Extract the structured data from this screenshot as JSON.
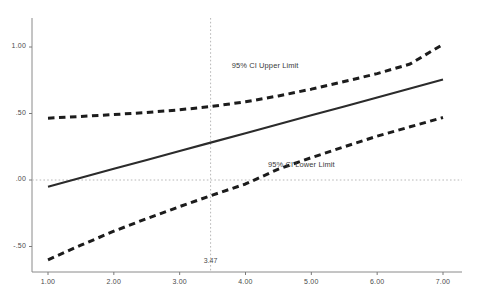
{
  "chart_data": {
    "type": "line",
    "title": "",
    "subtitle": "",
    "xlabel": "",
    "ylabel": "",
    "xlim": [
      0.7,
      7.35
    ],
    "ylim": [
      -0.7,
      1.13
    ],
    "grid": false,
    "legend_position": "inline-annotations",
    "x_ticks": [
      "1.00",
      "2.00",
      "3.00",
      "4.00",
      "5.00",
      "6.00",
      "7.00"
    ],
    "x_tick_values": [
      1.0,
      2.0,
      3.0,
      4.0,
      5.0,
      6.0,
      7.0
    ],
    "y_ticks": [
      "1.00",
      ".50",
      ".00",
      "-.50"
    ],
    "y_tick_values": [
      1.0,
      0.5,
      0.0,
      -0.5
    ],
    "x": [
      1.0,
      1.5,
      2.0,
      2.5,
      3.0,
      3.47,
      4.0,
      4.5,
      5.0,
      5.5,
      6.0,
      6.5,
      7.0
    ],
    "series": [
      {
        "name": "Fit Line",
        "style": "solid",
        "color": "#2b2b2b",
        "values": [
          -0.05,
          0.017,
          0.084,
          0.151,
          0.218,
          0.281,
          0.352,
          0.419,
          0.486,
          0.553,
          0.621,
          0.688,
          0.755
        ]
      },
      {
        "name": "95% CI Upper Limit",
        "style": "dashed",
        "color": "#1c1c1c",
        "values": [
          0.465,
          0.478,
          0.492,
          0.508,
          0.528,
          0.552,
          0.588,
          0.632,
          0.683,
          0.74,
          0.8,
          0.872,
          1.02
        ]
      },
      {
        "name": "95% CI Lower Limit",
        "style": "dashed",
        "color": "#1c1c1c",
        "values": [
          -0.6,
          -0.49,
          -0.385,
          -0.29,
          -0.2,
          -0.118,
          -0.03,
          0.082,
          0.168,
          0.25,
          0.33,
          0.4,
          0.47
        ]
      }
    ],
    "annotations": [
      {
        "name": "upper-limit-label",
        "text": "95% CI Upper Limit",
        "x": 4.55,
        "y": 0.855
      },
      {
        "name": "lower-limit-label",
        "text": "95% CI Lower Limit",
        "x": 5.1,
        "y": 0.11
      },
      {
        "name": "vertical-reference-label",
        "text": "3.47",
        "x": 3.47,
        "y": -0.62
      }
    ],
    "reference_lines": [
      {
        "name": "vertical-reference-line",
        "orientation": "vertical",
        "value": 3.47,
        "style": "dotted"
      },
      {
        "name": "horizontal-zero-line",
        "orientation": "horizontal",
        "value": 0.0,
        "style": "dotted"
      }
    ]
  },
  "axes": {
    "axis_color": "#8a8a8a",
    "tick_color": "#7a7a7a",
    "reference_color": "#b8b8b8"
  }
}
